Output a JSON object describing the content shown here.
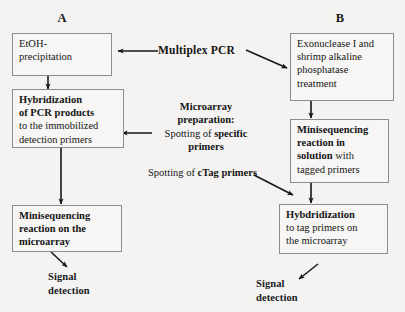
{
  "figure": {
    "background_color": "#f4f3f1",
    "box_border_color": "#8d8d8d",
    "arrow_color": "#161616"
  },
  "columns": {
    "left_label": "A",
    "right_label": "B"
  },
  "center": {
    "multiplex_pcr": "Multiplex PCR",
    "microarray_title_line1": "Microarray",
    "microarray_title_line2": "preparation:",
    "spotting_specific_prefix": "Spotting of ",
    "spotting_specific_bold1": "specific",
    "spotting_specific_bold2": "primers",
    "spotting_ctag_prefix": "Spotting of ",
    "spotting_ctag_bold": "cTag primers"
  },
  "left_column": {
    "box_etoh": {
      "line1": "EtOH-",
      "line2": "precipitation"
    },
    "box_hybridization": {
      "bold_line1": "Hybridization",
      "bold_line2": "of PCR products",
      "plain_line1": "to the immobilized",
      "plain_line2": "detection primers"
    },
    "box_minisequencing": {
      "bold_line1": "Minisequencing",
      "bold_line2": "reaction on the",
      "bold_line3": "microarray"
    },
    "signal": {
      "line1": "Signal",
      "line2": "detection"
    }
  },
  "right_column": {
    "box_exonuclease": {
      "line1": "Exonuclease I and",
      "line2": "shrimp alkaline",
      "line3": "phosphatase",
      "line4": "treatment"
    },
    "box_minisequencing_solution": {
      "bold_line1": "Minisequencing",
      "bold_line2": "reaction in",
      "bold_line3": "solution",
      "plain_tail": " with",
      "plain_line4": "tagged primers"
    },
    "box_hybdridization": {
      "bold_line1": "Hybdridization",
      "plain_line1": "to tag primers on",
      "plain_line2": "the microarray"
    },
    "signal": {
      "line1": "Signal",
      "line2": "detection"
    }
  }
}
